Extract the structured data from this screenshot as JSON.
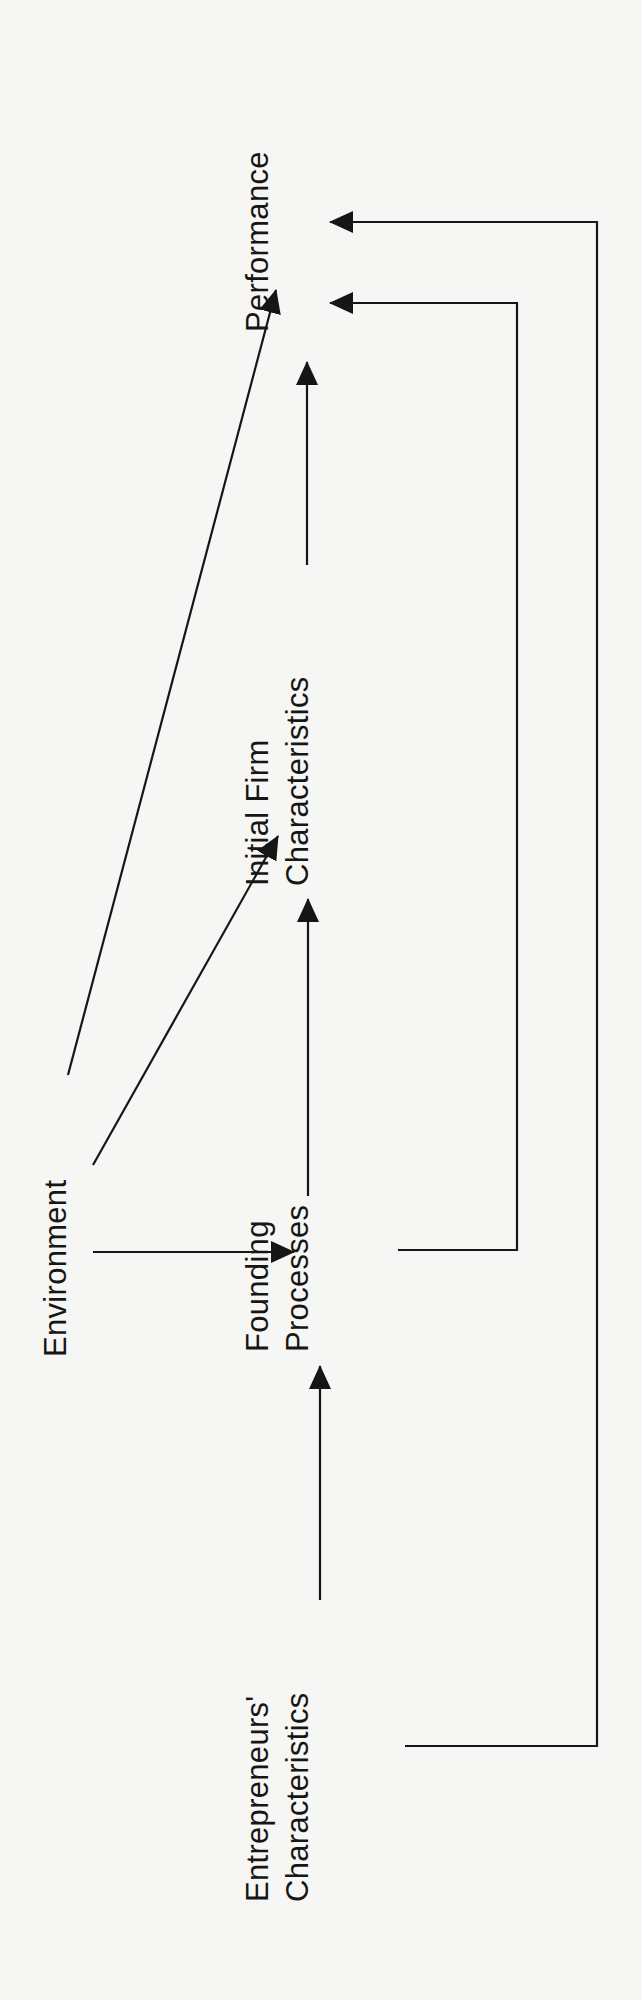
{
  "diagram": {
    "orientation": "rotated-90-ccw",
    "stroke_color": "#161616",
    "background_color": "#f6f6f4",
    "nodes": {
      "environment": {
        "line1": "Environment"
      },
      "founding": {
        "line1": "Founding",
        "line2": "Processes"
      },
      "initial_firm": {
        "line1": "Initial Firm",
        "line2": "Characteristics"
      },
      "performance": {
        "line1": "Performance"
      },
      "entrepreneurs": {
        "line1": "Entrepreneurs'",
        "line2": "Characteristics"
      }
    },
    "edges": [
      {
        "from": "Environment",
        "to": "Performance"
      },
      {
        "from": "Environment",
        "to": "Initial Firm Characteristics"
      },
      {
        "from": "Environment",
        "to": "Founding Processes"
      },
      {
        "from": "Entrepreneurs' Characteristics",
        "to": "Founding Processes"
      },
      {
        "from": "Founding Processes",
        "to": "Initial Firm Characteristics"
      },
      {
        "from": "Initial Firm Characteristics",
        "to": "Performance"
      },
      {
        "from": "Founding Processes",
        "to": "Performance"
      },
      {
        "from": "Entrepreneurs' Characteristics",
        "to": "Performance"
      }
    ]
  }
}
